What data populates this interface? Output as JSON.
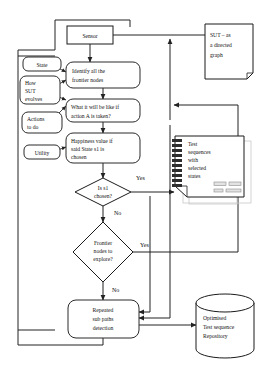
{
  "diagram": {
    "type": "flowchart"
  },
  "nodes": {
    "sensor": {
      "label": "Sensor",
      "shape": "rectangle"
    },
    "state": {
      "label": "State",
      "shape": "rounded-rectangle"
    },
    "how_sut_evolves": {
      "line1": "How",
      "line2": "SUT",
      "line3": "evolves",
      "shape": "rounded-rectangle"
    },
    "actions_to_do": {
      "line1": "Actions",
      "line2": "to do",
      "shape": "rounded-rectangle"
    },
    "utility": {
      "label": "Utility",
      "shape": "rounded-rectangle"
    },
    "identify_frontier": {
      "line1": "Identify  all the",
      "line2": "frontier nodes",
      "shape": "rounded-rectangle"
    },
    "what_if_action": {
      "line1": "What it will be like if",
      "line2": "action A is taken?",
      "shape": "rounded-rectangle"
    },
    "happiness_value": {
      "line1": "Happiness value if",
      "line2": "said  State s1 is",
      "line3": "chosen",
      "shape": "rounded-rectangle"
    },
    "is_s1_chosen": {
      "line1": "Is s1",
      "line2": "chosen?",
      "shape": "diamond"
    },
    "frontier_nodes_explore": {
      "line1": "Frontier",
      "line2": "nodes to",
      "line3": "explore?",
      "shape": "diamond"
    },
    "repeated_sub_paths": {
      "line1": "Repeated",
      "line2": "sub paths",
      "line3": "detection",
      "shape": "rounded-rectangle"
    },
    "sut_directed_graph": {
      "line1": "SUT – as",
      "line2": "a directed",
      "line3": "graph",
      "shape": "document"
    },
    "test_sequences_note": {
      "line1": "Test",
      "line2": "sequences",
      "line3": "with",
      "line4": "selected",
      "line5": "states",
      "shape": "spiral-notepad"
    },
    "repository": {
      "line1": "Optimised",
      "line2": "Test sequence",
      "line3": "Repository",
      "shape": "cylinder"
    }
  },
  "edge_labels": {
    "is_s1_yes": "Yes",
    "is_s1_no": "No",
    "frontier_yes": "Yes",
    "frontier_no": "No"
  },
  "colors": {
    "stroke": "#1a1a1a",
    "background": "#ffffff",
    "note_gray": "#9a9a9a",
    "ghost_gray": "#c9c9c9"
  }
}
